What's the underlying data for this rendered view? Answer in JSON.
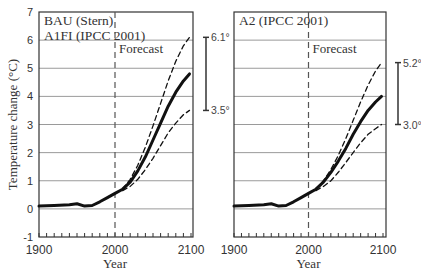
{
  "chart_data": [
    {
      "type": "line",
      "panel": "left",
      "title": "BAU (Stern)\nA1FI (IPCC 2001)",
      "title_lines": [
        "BAU (Stern)",
        "A1FI (IPCC 2001)"
      ],
      "annotation": "Forecast",
      "forecast_line_x": 2000,
      "xlabel": "Year",
      "ylabel": "Temperature change (°C)",
      "xlim": [
        1900,
        2100
      ],
      "ylim": [
        -1,
        7
      ],
      "x_ticks": [
        "1900",
        "2000",
        "2100"
      ],
      "y_ticks": [
        "-1",
        "0",
        "1",
        "2",
        "3",
        "4",
        "5",
        "6",
        "7"
      ],
      "grid": "horizontal",
      "range_bar": {
        "high_label": "6.1°",
        "low_label": "3.5°",
        "high": 6.1,
        "low": 3.5
      },
      "series": [
        {
          "name": "central",
          "style": "solid-thick",
          "x": [
            1900,
            1920,
            1940,
            1950,
            1960,
            1970,
            1980,
            1990,
            2000,
            2010,
            2020,
            2030,
            2040,
            2050,
            2060,
            2070,
            2080,
            2090,
            2098
          ],
          "y": [
            0.1,
            0.12,
            0.15,
            0.18,
            0.1,
            0.12,
            0.25,
            0.4,
            0.55,
            0.7,
            0.95,
            1.35,
            1.85,
            2.45,
            3.05,
            3.65,
            4.15,
            4.55,
            4.8
          ]
        },
        {
          "name": "upper",
          "style": "dashed",
          "x": [
            2010,
            2020,
            2030,
            2040,
            2050,
            2060,
            2070,
            2080,
            2090,
            2098
          ],
          "y": [
            0.7,
            1.05,
            1.55,
            2.2,
            2.95,
            3.75,
            4.55,
            5.25,
            5.8,
            6.1
          ]
        },
        {
          "name": "lower",
          "style": "dashed",
          "x": [
            2010,
            2020,
            2030,
            2040,
            2050,
            2060,
            2070,
            2080,
            2090,
            2098
          ],
          "y": [
            0.65,
            0.8,
            1.05,
            1.4,
            1.8,
            2.25,
            2.7,
            3.05,
            3.35,
            3.5
          ]
        }
      ]
    },
    {
      "type": "line",
      "panel": "right",
      "title": "A2 (IPCC 2001)",
      "title_lines": [
        "A2 (IPCC 2001)"
      ],
      "annotation": "Forecast",
      "forecast_line_x": 2000,
      "xlabel": "Year",
      "ylabel": "",
      "xlim": [
        1900,
        2100
      ],
      "ylim": [
        -1,
        7
      ],
      "x_ticks": [
        "1900",
        "2000",
        "2100"
      ],
      "y_ticks": [],
      "grid": "horizontal",
      "range_bar": {
        "high_label": "5.2°",
        "low_label": "3.0°",
        "high": 5.2,
        "low": 3.0
      },
      "series": [
        {
          "name": "central",
          "style": "solid-thick",
          "x": [
            1900,
            1920,
            1940,
            1950,
            1960,
            1970,
            1980,
            1990,
            2000,
            2010,
            2020,
            2030,
            2040,
            2050,
            2060,
            2070,
            2080,
            2090,
            2098
          ],
          "y": [
            0.1,
            0.12,
            0.15,
            0.18,
            0.1,
            0.12,
            0.25,
            0.4,
            0.55,
            0.7,
            0.95,
            1.3,
            1.7,
            2.15,
            2.65,
            3.1,
            3.5,
            3.8,
            4.0
          ]
        },
        {
          "name": "upper",
          "style": "dashed",
          "x": [
            2010,
            2020,
            2030,
            2040,
            2050,
            2060,
            2070,
            2080,
            2090,
            2098
          ],
          "y": [
            0.7,
            1.0,
            1.4,
            1.9,
            2.5,
            3.15,
            3.8,
            4.4,
            4.9,
            5.2
          ]
        },
        {
          "name": "lower",
          "style": "dashed",
          "x": [
            2010,
            2020,
            2030,
            2040,
            2050,
            2060,
            2070,
            2080,
            2090,
            2098
          ],
          "y": [
            0.65,
            0.8,
            1.0,
            1.3,
            1.65,
            2.0,
            2.35,
            2.65,
            2.85,
            3.0
          ]
        }
      ]
    }
  ]
}
